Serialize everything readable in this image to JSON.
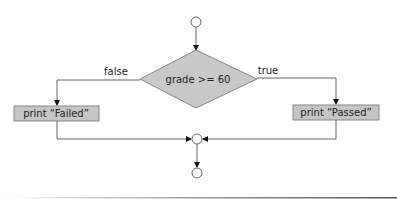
{
  "diagram": {
    "type": "flowchart",
    "colors": {
      "node_fill": "#c8c8c8",
      "stroke": "#555555",
      "background": "#ffffff"
    },
    "decision": {
      "label": "grade >= 60"
    },
    "branches": {
      "false_label": "false",
      "true_label": "true"
    },
    "actions": {
      "failed": "print “Failed”",
      "passed": "print “Passed”"
    },
    "nodes": [
      {
        "id": "start",
        "kind": "initial-circle"
      },
      {
        "id": "decision",
        "kind": "diamond",
        "text": "grade >= 60"
      },
      {
        "id": "failed",
        "kind": "action",
        "text": "print “Failed”"
      },
      {
        "id": "passed",
        "kind": "action",
        "text": "print “Passed”"
      },
      {
        "id": "merge",
        "kind": "merge-circle"
      },
      {
        "id": "end",
        "kind": "final-circle"
      }
    ],
    "edges": [
      {
        "from": "start",
        "to": "decision",
        "label": ""
      },
      {
        "from": "decision",
        "to": "failed",
        "label": "false"
      },
      {
        "from": "decision",
        "to": "passed",
        "label": "true"
      },
      {
        "from": "failed",
        "to": "merge",
        "label": ""
      },
      {
        "from": "passed",
        "to": "merge",
        "label": ""
      },
      {
        "from": "merge",
        "to": "end",
        "label": ""
      }
    ]
  }
}
